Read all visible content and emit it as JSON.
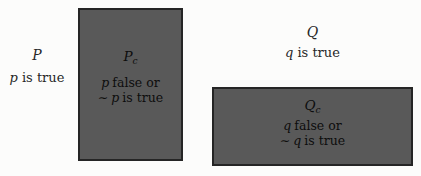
{
  "colors": {
    "box_fill": "#595959",
    "box_border": "#252525",
    "box_text": "#0d0d0d",
    "label_text": "#272727",
    "page_bg": "#fcfcfb"
  },
  "p_region": {
    "title": "P",
    "statement_var": "p",
    "statement_text": "is true"
  },
  "p_complement": {
    "label_main": "P",
    "label_sub": "c",
    "line1_var": "p",
    "line1_text": "false or",
    "line2_neg": "∼",
    "line2_var": "p",
    "line2_text": "is true"
  },
  "q_region": {
    "title": "Q",
    "statement_var": "q",
    "statement_text": "is true"
  },
  "q_complement": {
    "label_main": "Q",
    "label_sub": "c",
    "line1_var": "q",
    "line1_text": "false or",
    "line2_neg": "∼",
    "line2_var": "q",
    "line2_text": "is true"
  }
}
